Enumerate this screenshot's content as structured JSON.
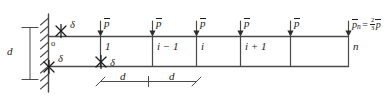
{
  "figure": {
    "type": "structural-frame-diagram",
    "colors": {
      "line": "#4a4a4a",
      "text": "#1b1b1b",
      "background": "#ffffff"
    }
  },
  "wall": {
    "label": "fixed-support-wall",
    "hatch_count": 9
  },
  "height_dimension": {
    "label": "d"
  },
  "span_dimensions": [
    {
      "label": "d"
    },
    {
      "label": "d"
    }
  ],
  "origin_label": "o",
  "delta_labels": [
    {
      "name": "delta-top-wall",
      "text": "δ"
    },
    {
      "name": "delta-bottom-wall",
      "text": "δ"
    },
    {
      "name": "delta-bottom-node1",
      "text": "δ"
    }
  ],
  "loads": [
    {
      "name": "load-1",
      "symbol": "p",
      "overbar": true
    },
    {
      "name": "load-2",
      "symbol": "p",
      "overbar": true
    },
    {
      "name": "load-3",
      "symbol": "p",
      "overbar": true
    },
    {
      "name": "load-4",
      "symbol": "p",
      "overbar": true
    },
    {
      "name": "load-5",
      "symbol": "p",
      "overbar": true
    }
  ],
  "end_load": {
    "name": "load-n",
    "symbol": "p",
    "subscript": "n",
    "equals": "=",
    "fraction_numerator": "2",
    "fraction_denominator": "3",
    "factor_symbol": "p"
  },
  "cells": [
    {
      "name": "cell-1",
      "label": "1"
    },
    {
      "name": "cell-i-1",
      "label": "i − 1"
    },
    {
      "name": "cell-i",
      "label": "i"
    },
    {
      "name": "cell-i+1",
      "label": "i + 1"
    },
    {
      "name": "cell-blank",
      "label": ""
    },
    {
      "name": "cell-n",
      "label": "n"
    }
  ]
}
